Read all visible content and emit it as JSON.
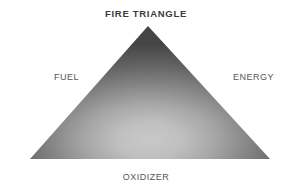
{
  "diagram": {
    "title": "FIRE TRIANGLE",
    "type": "fire-triangle",
    "shape": "triangle",
    "background_color": "#ffffff",
    "title_color": "#3a3a3a",
    "label_color": "#565656",
    "fill_center_color": "#c6c6c6",
    "fill_edge_color": "#474747",
    "vertices": [
      {
        "id": "fuel",
        "label": "FUEL",
        "position": "left"
      },
      {
        "id": "energy",
        "label": "ENERGY",
        "position": "right"
      },
      {
        "id": "oxidizer",
        "label": "OXIDIZER",
        "position": "bottom"
      }
    ],
    "geometry": {
      "apex": [
        148,
        26
      ],
      "bottom_left": [
        30,
        159
      ],
      "bottom_right": [
        270,
        159
      ],
      "gradient_center": [
        150,
        140
      ]
    }
  }
}
